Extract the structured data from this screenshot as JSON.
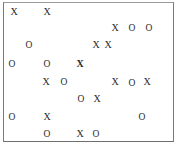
{
  "diagram": {
    "type": "tic-tac-scatter",
    "frame": {
      "border_color": "#7a7a7a",
      "background": "#ffffff"
    },
    "mark_color": "#2a2a2a",
    "marks": [
      {
        "symbol": "X",
        "x": 14,
        "y": 12
      },
      {
        "symbol": "X",
        "x": 47,
        "y": 12
      },
      {
        "symbol": "X",
        "x": 115,
        "y": 28
      },
      {
        "symbol": "O",
        "x": 132,
        "y": 28
      },
      {
        "symbol": "O",
        "x": 149,
        "y": 28
      },
      {
        "symbol": "O",
        "x": 29,
        "y": 45
      },
      {
        "symbol": "X",
        "x": 96,
        "y": 45
      },
      {
        "symbol": "X",
        "x": 108,
        "y": 45
      },
      {
        "symbol": "O",
        "x": 12,
        "y": 64
      },
      {
        "symbol": "O",
        "x": 47,
        "y": 64
      },
      {
        "symbol": "X",
        "x": 80,
        "y": 64,
        "bold": true
      },
      {
        "symbol": "X",
        "x": 46,
        "y": 82
      },
      {
        "symbol": "O",
        "x": 64,
        "y": 82
      },
      {
        "symbol": "X",
        "x": 115,
        "y": 82
      },
      {
        "symbol": "O",
        "x": 132,
        "y": 83
      },
      {
        "symbol": "X",
        "x": 147,
        "y": 82
      },
      {
        "symbol": "O",
        "x": 81,
        "y": 99
      },
      {
        "symbol": "X",
        "x": 97,
        "y": 99
      },
      {
        "symbol": "O",
        "x": 12,
        "y": 117
      },
      {
        "symbol": "X",
        "x": 47,
        "y": 117
      },
      {
        "symbol": "O",
        "x": 142,
        "y": 117
      },
      {
        "symbol": "O",
        "x": 47,
        "y": 134
      },
      {
        "symbol": "X",
        "x": 80,
        "y": 134
      },
      {
        "symbol": "O",
        "x": 96,
        "y": 134
      }
    ]
  }
}
